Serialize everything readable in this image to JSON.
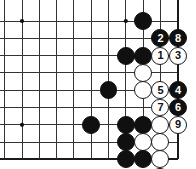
{
  "figure": {
    "kind": "go-board-diagram",
    "width": 196,
    "height": 169,
    "background_color": "#ffffff"
  },
  "board": {
    "line_color": "#333333",
    "edge_line_color": "#1a1a1a",
    "line_width": 1,
    "edge_line_width": 2,
    "cell_size": 17.3,
    "origin_x": 4.7,
    "origin_y": 21,
    "right_edge_col": 10,
    "bottom_edge_row": 8,
    "cols": 11,
    "rows": 9,
    "star_points": [
      {
        "col": 1,
        "row": 0
      },
      {
        "col": 7,
        "row": 0
      },
      {
        "col": 1,
        "row": 6
      }
    ]
  },
  "stones": [
    {
      "col": 8,
      "row": 0,
      "color": "black",
      "label": ""
    },
    {
      "col": 9,
      "row": 1,
      "color": "black",
      "label": "2"
    },
    {
      "col": 10,
      "row": 1,
      "color": "black",
      "label": "8"
    },
    {
      "col": 7,
      "row": 2,
      "color": "black",
      "label": ""
    },
    {
      "col": 8,
      "row": 2,
      "color": "black",
      "label": ""
    },
    {
      "col": 9,
      "row": 2,
      "color": "white",
      "label": "1"
    },
    {
      "col": 10,
      "row": 2,
      "color": "white",
      "label": "3"
    },
    {
      "col": 8,
      "row": 3,
      "color": "white",
      "label": ""
    },
    {
      "col": 6,
      "row": 4,
      "color": "black",
      "label": ""
    },
    {
      "col": 8,
      "row": 4,
      "color": "white",
      "label": ""
    },
    {
      "col": 9,
      "row": 4,
      "color": "white",
      "label": "5"
    },
    {
      "col": 10,
      "row": 4,
      "color": "black",
      "label": "4"
    },
    {
      "col": 9,
      "row": 5,
      "color": "white",
      "label": "7"
    },
    {
      "col": 10,
      "row": 5,
      "color": "black",
      "label": "6"
    },
    {
      "col": 5,
      "row": 6,
      "color": "black",
      "label": ""
    },
    {
      "col": 7,
      "row": 6,
      "color": "black",
      "label": ""
    },
    {
      "col": 8,
      "row": 6,
      "color": "black",
      "label": ""
    },
    {
      "col": 9,
      "row": 6,
      "color": "white",
      "label": ""
    },
    {
      "col": 10,
      "row": 6,
      "color": "white",
      "label": "9"
    },
    {
      "col": 7,
      "row": 7,
      "color": "black",
      "label": ""
    },
    {
      "col": 8,
      "row": 7,
      "color": "white",
      "label": ""
    },
    {
      "col": 9,
      "row": 7,
      "color": "white",
      "label": ""
    },
    {
      "col": 7,
      "row": 8,
      "color": "black",
      "label": ""
    },
    {
      "col": 8,
      "row": 8,
      "color": "black",
      "label": ""
    },
    {
      "col": 9,
      "row": 8,
      "color": "white",
      "label": ""
    },
    {
      "col": 9,
      "row": 9,
      "color": "black",
      "label": ""
    }
  ],
  "move_numbers": [
    "1",
    "2",
    "3",
    "4",
    "5",
    "6",
    "7",
    "8",
    "9"
  ],
  "colors": {
    "black_stone": "#101010",
    "white_stone": "#ffffff",
    "stone_outline": "#1a1a1a",
    "grid": "#333333",
    "black_label_text": "#ffffff",
    "white_label_text": "#101010"
  }
}
